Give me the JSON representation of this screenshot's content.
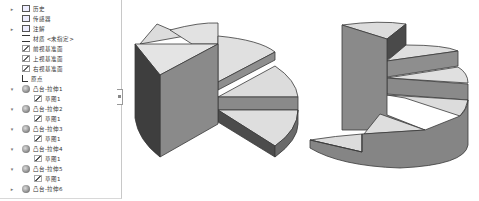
{
  "feature_tree": {
    "items": [
      {
        "label": "历史",
        "icon": "history-icon",
        "expander": "▸",
        "indent": 0
      },
      {
        "label": "传感器",
        "icon": "sensor-icon",
        "expander": "",
        "indent": 0
      },
      {
        "label": "注解",
        "icon": "annotation-icon",
        "expander": "▸",
        "indent": 0
      },
      {
        "label": "材质 <未指定>",
        "icon": "material-icon",
        "expander": "",
        "indent": 0
      },
      {
        "label": "前视基准面",
        "icon": "plane-icon",
        "expander": "",
        "indent": 0
      },
      {
        "label": "上视基准面",
        "icon": "plane-icon",
        "expander": "",
        "indent": 0
      },
      {
        "label": "右视基准面",
        "icon": "plane-icon",
        "expander": "",
        "indent": 0
      },
      {
        "label": "原点",
        "icon": "origin-icon",
        "expander": "",
        "indent": 0
      },
      {
        "label": "凸台-拉伸1",
        "icon": "extrude-icon",
        "expander": "▾",
        "indent": 0
      },
      {
        "label": "草图1",
        "icon": "sketch-icon",
        "expander": "",
        "indent": 1
      },
      {
        "label": "凸台-拉伸2",
        "icon": "extrude-icon",
        "expander": "▾",
        "indent": 0
      },
      {
        "label": "草图1",
        "icon": "sketch-icon",
        "expander": "",
        "indent": 1
      },
      {
        "label": "凸台-拉伸3",
        "icon": "extrude-icon",
        "expander": "▾",
        "indent": 0
      },
      {
        "label": "草图1",
        "icon": "sketch-icon",
        "expander": "",
        "indent": 1
      },
      {
        "label": "凸台-拉伸4",
        "icon": "extrude-icon",
        "expander": "▾",
        "indent": 0
      },
      {
        "label": "草图1",
        "icon": "sketch-icon",
        "expander": "",
        "indent": 1
      },
      {
        "label": "凸台-拉伸5",
        "icon": "extrude-icon",
        "expander": "▾",
        "indent": 0
      },
      {
        "label": "草图1",
        "icon": "sketch-icon",
        "expander": "",
        "indent": 1
      },
      {
        "label": "凸台-拉伸6",
        "icon": "extrude-icon",
        "expander": "▸",
        "indent": 0
      }
    ]
  },
  "viewport": {
    "model_left": "stepped-pie-model-view-1",
    "model_right": "spiral-stair-model-view-2"
  },
  "colors": {
    "top_face": "#d9d9d9",
    "side_face": "#8c8c8c",
    "dark_face": "#4a4a4a",
    "edge": "#3a3a3a"
  }
}
